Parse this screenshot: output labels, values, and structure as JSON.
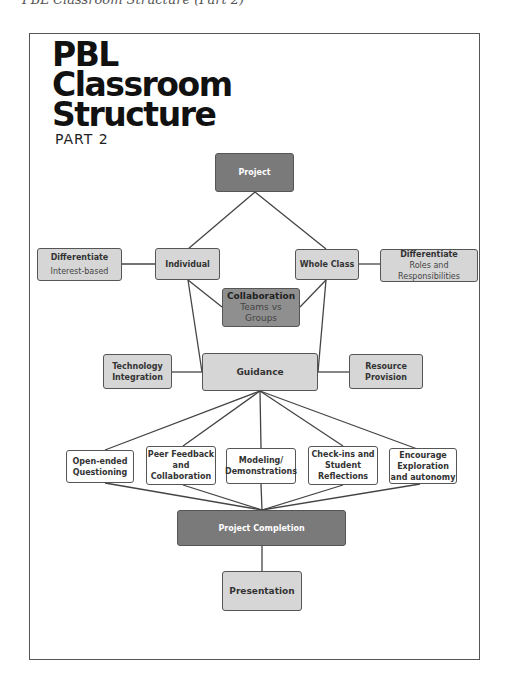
{
  "caption": "PBL Classroom Structure (Part 2)",
  "title": {
    "line1": "PBL",
    "line2": "Classroom",
    "line3": "Structure",
    "subtitle": "PART 2"
  },
  "nodes": {
    "project": "Project",
    "individual": "Individual",
    "whole_class": "Whole Class",
    "diff_left": {
      "title": "Differentiate",
      "sub": "Interest-based"
    },
    "diff_right": {
      "title": "Differentiate",
      "sub1": "Roles and",
      "sub2": "Responsibilities"
    },
    "collaboration": {
      "title": "Collaboration",
      "sub1": "Teams vs",
      "sub2": "Groups"
    },
    "guidance": "Guidance",
    "technology": {
      "l1": "Technology",
      "l2": "Integration"
    },
    "resource": {
      "l1": "Resource",
      "l2": "Provision"
    },
    "open_ended": {
      "l1": "Open-ended",
      "l2": "Questioning"
    },
    "peer_feedback": {
      "l1": "Peer Feedback",
      "l2": "and",
      "l3": "Collaboration"
    },
    "modeling": {
      "l1": "Modeling/",
      "l2": "Demonstrations"
    },
    "checkins": {
      "l1": "Check-ins and",
      "l2": "Student",
      "l3": "Reflections"
    },
    "encourage": {
      "l1": "Encourage",
      "l2": "Exploration",
      "l3": "and autonomy"
    },
    "completion": "Project Completion",
    "presentation": "Presentation"
  },
  "colors": {
    "dark": "#7a7a7a",
    "light": "#d6d6d6",
    "mid": "#8f8f8f",
    "line": "#444444"
  }
}
